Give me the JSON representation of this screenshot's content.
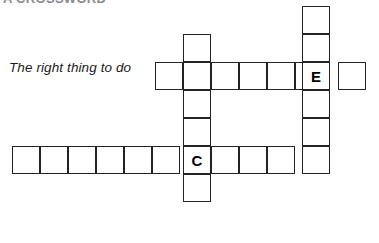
{
  "page": {
    "background_color": "#ffffff",
    "width": 379,
    "height": 243
  },
  "header": {
    "partial_text": "A CROSSWORD",
    "note": "text clipped at top edge of image"
  },
  "clue": {
    "text": "The right thing to do",
    "style": "italic"
  },
  "grid": {
    "cell_size": 28,
    "border_color": "#232323",
    "cell_fill": "#ffffff",
    "letter_color": "#000000",
    "entries": [
      {
        "id": "across-upper",
        "direction": "across",
        "length": 7,
        "origin": {
          "x": 155,
          "y": 62
        },
        "letters": [
          "",
          "",
          "",
          "",
          "",
          "E",
          ""
        ],
        "filled_index": 5
      },
      {
        "id": "across-lower",
        "direction": "across",
        "length": 11,
        "origin": {
          "x": 12,
          "y": 146
        },
        "letters": [
          "",
          "",
          "",
          "",
          "",
          "",
          "C",
          "",
          "",
          "",
          ""
        ],
        "filled_index": 6
      },
      {
        "id": "down-left",
        "direction": "down",
        "length": 6,
        "origin": {
          "x": 183,
          "y": 34
        },
        "letters": [
          "",
          "",
          "",
          "",
          "C",
          ""
        ],
        "filled_index": 4
      },
      {
        "id": "down-right",
        "direction": "down",
        "length": 6,
        "origin": {
          "x": 302,
          "y": 6
        },
        "letters": [
          "",
          "",
          "E",
          "",
          "",
          ""
        ],
        "filled_index": 2
      }
    ],
    "cells": [
      {
        "name": "cell-across-upper-1",
        "x": 155,
        "y": 62,
        "letter": ""
      },
      {
        "name": "cell-across-upper-2",
        "x": 183,
        "y": 62,
        "letter": ""
      },
      {
        "name": "cell-across-upper-3",
        "x": 211,
        "y": 62,
        "letter": ""
      },
      {
        "name": "cell-across-upper-4",
        "x": 239,
        "y": 62,
        "letter": ""
      },
      {
        "name": "cell-across-upper-5",
        "x": 267,
        "y": 62,
        "letter": ""
      },
      {
        "name": "cell-across-upper-6",
        "x": 295,
        "y": 62,
        "letter": ""
      },
      {
        "name": "cell-across-upper-7",
        "x": 338,
        "y": 62,
        "letter": ""
      },
      {
        "name": "cell-down-left-1",
        "x": 183,
        "y": 34,
        "letter": ""
      },
      {
        "name": "cell-down-left-3",
        "x": 183,
        "y": 90,
        "letter": ""
      },
      {
        "name": "cell-down-left-4",
        "x": 183,
        "y": 118,
        "letter": ""
      },
      {
        "name": "cell-down-left-6",
        "x": 183,
        "y": 174,
        "letter": ""
      },
      {
        "name": "cell-down-right-1",
        "x": 302,
        "y": 6,
        "letter": ""
      },
      {
        "name": "cell-down-right-2",
        "x": 302,
        "y": 34,
        "letter": ""
      },
      {
        "name": "cell-down-right-3",
        "x": 302,
        "y": 62,
        "letter": "E"
      },
      {
        "name": "cell-down-right-4",
        "x": 302,
        "y": 90,
        "letter": ""
      },
      {
        "name": "cell-down-right-5",
        "x": 302,
        "y": 118,
        "letter": ""
      },
      {
        "name": "cell-across-lower-1",
        "x": 12,
        "y": 146,
        "letter": ""
      },
      {
        "name": "cell-across-lower-2",
        "x": 40,
        "y": 146,
        "letter": ""
      },
      {
        "name": "cell-across-lower-3",
        "x": 68,
        "y": 146,
        "letter": ""
      },
      {
        "name": "cell-across-lower-4",
        "x": 96,
        "y": 146,
        "letter": ""
      },
      {
        "name": "cell-across-lower-5",
        "x": 124,
        "y": 146,
        "letter": ""
      },
      {
        "name": "cell-across-lower-6",
        "x": 152,
        "y": 146,
        "letter": ""
      },
      {
        "name": "cell-across-lower-7",
        "x": 183,
        "y": 146,
        "letter": "C"
      },
      {
        "name": "cell-across-lower-8",
        "x": 211,
        "y": 146,
        "letter": ""
      },
      {
        "name": "cell-across-lower-9",
        "x": 239,
        "y": 146,
        "letter": ""
      },
      {
        "name": "cell-across-lower-10",
        "x": 267,
        "y": 146,
        "letter": ""
      },
      {
        "name": "cell-across-lower-11",
        "x": 302,
        "y": 146,
        "letter": ""
      }
    ]
  }
}
